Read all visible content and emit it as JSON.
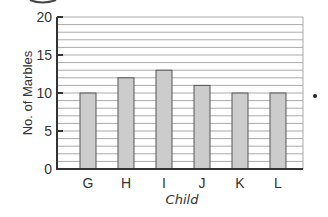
{
  "chart_data": {
    "type": "bar",
    "title": "",
    "xlabel": "Child",
    "ylabel": "No. of Marbles",
    "categories": [
      "G",
      "H",
      "I",
      "J",
      "K",
      "L"
    ],
    "values": [
      10,
      12,
      13,
      11,
      10,
      10
    ],
    "ylim": [
      0,
      20
    ],
    "yticks": [
      0,
      5,
      10,
      15,
      20
    ],
    "minor_grid_step": 1,
    "grid": true,
    "legend": null
  },
  "colors": {
    "bar_fill": "#cccccc",
    "bar_stroke": "#555555",
    "grid": "#aaaaaa",
    "axis": "#333333",
    "text": "#333333"
  },
  "decorations": {
    "right_dot": "•"
  }
}
